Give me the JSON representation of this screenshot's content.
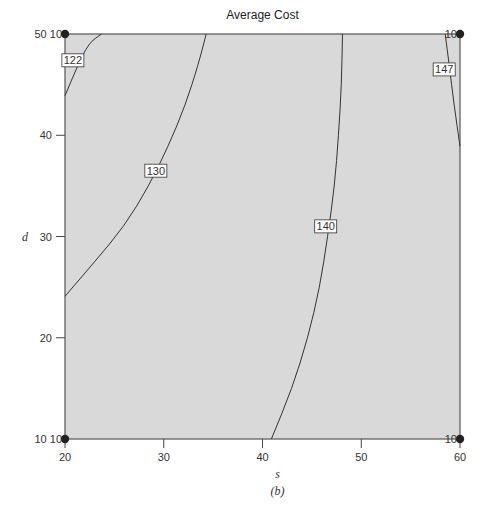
{
  "chart_data": {
    "type": "contour",
    "title": "Average Cost",
    "subtitle": "(b)",
    "xlabel": "s",
    "ylabel": "d",
    "xlim": [
      20,
      60
    ],
    "ylim": [
      10,
      50
    ],
    "xticks": [
      "20",
      "30",
      "40",
      "50",
      "60"
    ],
    "yticks": [
      "10",
      "20",
      "30",
      "40",
      "50"
    ],
    "grid": false,
    "contours": [
      {
        "level": "122",
        "points": [
          [
            20,
            43.9
          ],
          [
            21.2,
            46.7
          ],
          [
            22.4,
            49.1
          ],
          [
            23.7,
            50
          ]
        ]
      },
      {
        "level": "130",
        "points": [
          [
            20,
            24.1
          ],
          [
            23,
            27.5
          ],
          [
            26,
            31
          ],
          [
            28.5,
            35
          ],
          [
            30.5,
            39
          ],
          [
            32.2,
            43
          ],
          [
            33.5,
            47
          ],
          [
            34.3,
            50
          ]
        ]
      },
      {
        "level": "140",
        "points": [
          [
            40.9,
            10
          ],
          [
            43,
            15
          ],
          [
            44.6,
            20
          ],
          [
            45.8,
            25
          ],
          [
            46.6,
            30
          ],
          [
            47.3,
            35
          ],
          [
            47.7,
            40
          ],
          [
            48,
            45
          ],
          [
            48.1,
            50
          ]
        ]
      },
      {
        "level": "147",
        "points": [
          [
            58.5,
            50
          ],
          [
            58.9,
            47
          ],
          [
            59.4,
            43
          ],
          [
            60,
            38.9
          ]
        ]
      }
    ],
    "corner_markers": [
      {
        "x": 20,
        "y": 50,
        "label": "50 10"
      },
      {
        "x": 60,
        "y": 50,
        "label": "10"
      },
      {
        "x": 20,
        "y": 10,
        "label": "10 10"
      },
      {
        "x": 60,
        "y": 10,
        "label": "10"
      }
    ],
    "label_positions": {
      "122": [
        20.8,
        47.4
      ],
      "130": [
        29.2,
        36.5
      ],
      "140": [
        46.4,
        31
      ],
      "147": [
        58.4,
        46.5
      ]
    },
    "fill_color": "#d9d9d9",
    "line_color": "#333333"
  }
}
